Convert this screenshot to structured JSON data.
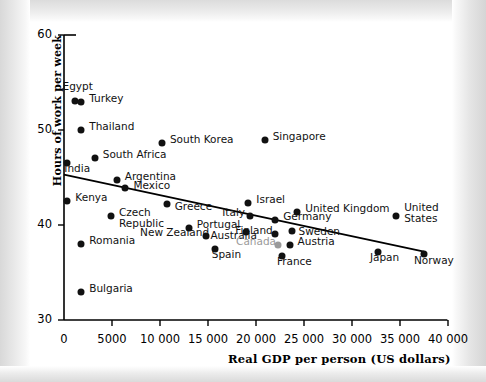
{
  "chart_data": {
    "type": "scatter",
    "title": "",
    "xlabel": "Real GDP per person (US dollars)",
    "ylabel": "Hours of work per week",
    "xlim": [
      0,
      40000
    ],
    "ylim": [
      30,
      60
    ],
    "xticks": [
      "0",
      "5000",
      "10 000",
      "15 000",
      "20 000",
      "25 000",
      "30 000",
      "35 000",
      "40 000"
    ],
    "xtick_values": [
      0,
      5000,
      10000,
      15000,
      20000,
      25000,
      30000,
      35000,
      40000
    ],
    "yticks": [
      "60",
      "50",
      "40",
      "30"
    ],
    "ytick_values": [
      60,
      50,
      40,
      30
    ],
    "grid": false,
    "legend": "none",
    "trendline": {
      "name": "fitted-trend-line",
      "x0": 0,
      "y0": 45.3,
      "x1": 37500,
      "y1": 37.2
    },
    "points": [
      {
        "name": "Egypt",
        "x": 1100,
        "y": 53.1,
        "label": "Egypt",
        "label_dx": -12,
        "label_dy": -15,
        "muted": false
      },
      {
        "name": "Turkey",
        "x": 1800,
        "y": 52.9,
        "label": "Turkey",
        "label_dx": 8,
        "label_dy": -4,
        "muted": false
      },
      {
        "name": "Thailand",
        "x": 1800,
        "y": 50.0,
        "label": "Thailand",
        "label_dx": 8,
        "label_dy": -4,
        "muted": false
      },
      {
        "name": "South Korea",
        "x": 10200,
        "y": 48.6,
        "label": "South Korea",
        "label_dx": 8,
        "label_dy": -4,
        "muted": false
      },
      {
        "name": "South Africa",
        "x": 3200,
        "y": 47.1,
        "label": "South Africa",
        "label_dx": 8,
        "label_dy": -4,
        "muted": false
      },
      {
        "name": "India",
        "x": 350,
        "y": 46.5,
        "label": "India",
        "label_dx": -3,
        "label_dy": 5,
        "muted": false
      },
      {
        "name": "Argentina",
        "x": 5500,
        "y": 44.7,
        "label": "Argentina",
        "label_dx": 8,
        "label_dy": -4,
        "muted": false
      },
      {
        "name": "Mexico",
        "x": 6400,
        "y": 43.9,
        "label": "Mexico",
        "label_dx": 8,
        "label_dy": -3,
        "muted": false
      },
      {
        "name": "Kenya",
        "x": 350,
        "y": 42.5,
        "label": "Kenya",
        "label_dx": 8,
        "label_dy": -4,
        "muted": false
      },
      {
        "name": "Czech Republic",
        "x": 4900,
        "y": 41.0,
        "label": "Czech Republic",
        "label_dx": 8,
        "label_dy": -4,
        "muted": false,
        "two_line": true
      },
      {
        "name": "Greece",
        "x": 10700,
        "y": 42.2,
        "label": "Greece",
        "label_dx": 8,
        "label_dy": 2,
        "muted": false
      },
      {
        "name": "Israel",
        "x": 19200,
        "y": 42.3,
        "label": "Israel",
        "label_dx": 8,
        "label_dy": -4,
        "muted": false
      },
      {
        "name": "United Kingdom",
        "x": 24300,
        "y": 41.4,
        "label": "United Kingdom",
        "label_dx": 8,
        "label_dy": -4,
        "muted": false
      },
      {
        "name": "United States",
        "x": 34600,
        "y": 41.0,
        "label": "United States",
        "label_dx": 8,
        "label_dy": -9,
        "muted": false,
        "two_line": true
      },
      {
        "name": "Italy",
        "x": 19400,
        "y": 40.9,
        "label": "Italy",
        "label_dx": -28,
        "label_dy": -4,
        "muted": false
      },
      {
        "name": "Germany",
        "x": 22000,
        "y": 40.5,
        "label": "Germany",
        "label_dx": 8,
        "label_dy": -4,
        "muted": false
      },
      {
        "name": "Portugal",
        "x": 13000,
        "y": 39.7,
        "label": "Portugal",
        "label_dx": 8,
        "label_dy": -4,
        "muted": false
      },
      {
        "name": "Australia",
        "x": 19000,
        "y": 39.3,
        "label": "Australia",
        "label_dx": -36,
        "label_dy": 3,
        "muted": false
      },
      {
        "name": "Finland",
        "x": 22000,
        "y": 39.1,
        "label": "Finland",
        "label_dx": -40,
        "label_dy": -4,
        "muted": false
      },
      {
        "name": "Sweden",
        "x": 23700,
        "y": 39.4,
        "label": "Sweden",
        "label_dx": 7,
        "label_dy": 0,
        "muted": false
      },
      {
        "name": "New Zealand",
        "x": 14800,
        "y": 38.8,
        "label": "New Zealand",
        "label_dx": -66,
        "label_dy": -4,
        "muted": false
      },
      {
        "name": "Romania",
        "x": 1800,
        "y": 38.0,
        "label": "Romania",
        "label_dx": 8,
        "label_dy": -4,
        "muted": false
      },
      {
        "name": "Canada",
        "x": 22300,
        "y": 37.9,
        "label": "Canada",
        "label_dx": -42,
        "label_dy": -4,
        "muted": true
      },
      {
        "name": "Austria",
        "x": 23500,
        "y": 37.9,
        "label": "Austria",
        "label_dx": 8,
        "label_dy": -4,
        "muted": false
      },
      {
        "name": "Spain",
        "x": 15700,
        "y": 37.5,
        "label": "Spain",
        "label_dx": -3,
        "label_dy": 5,
        "muted": false
      },
      {
        "name": "France",
        "x": 22700,
        "y": 36.7,
        "label": "France",
        "label_dx": -5,
        "label_dy": 5,
        "muted": false
      },
      {
        "name": "Japan",
        "x": 32700,
        "y": 37.2,
        "label": "Japan",
        "label_dx": -8,
        "label_dy": 5,
        "muted": false
      },
      {
        "name": "Norway",
        "x": 37500,
        "y": 36.9,
        "label": "Norway",
        "label_dx": -10,
        "label_dy": 6,
        "muted": false
      },
      {
        "name": "Singapore",
        "x": 20900,
        "y": 48.9,
        "label": "Singapore",
        "label_dx": 8,
        "label_dy": -4,
        "muted": false
      },
      {
        "name": "Bulgaria",
        "x": 1800,
        "y": 33.0,
        "label": "Bulgaria",
        "label_dx": 8,
        "label_dy": -4,
        "muted": false
      }
    ]
  },
  "axis": {
    "y_title": "Hours of work per week",
    "x_title": "Real GDP per person (US dollars)"
  },
  "colors": {
    "dot": "#111111",
    "dot_muted": "#9a9a9a",
    "axis": "#000000",
    "background": "#ffffff"
  }
}
